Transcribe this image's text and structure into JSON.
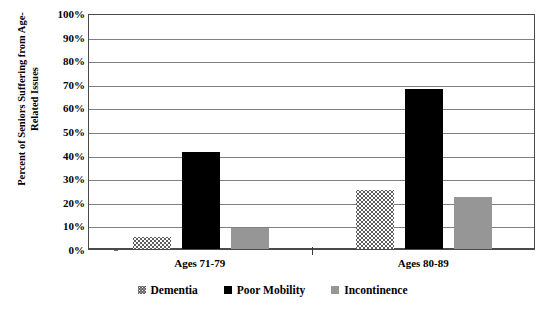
{
  "chart_data": {
    "type": "bar",
    "title": "",
    "xlabel": "",
    "ylabel": "Percent of Seniors Suffering from Age-Related Issues",
    "categories": [
      "Ages 71-79",
      "Ages 80-89"
    ],
    "series": [
      {
        "name": "Dementia",
        "values": [
          5,
          25
        ],
        "color": "#5e5e5e"
      },
      {
        "name": "Poor Mobility",
        "values": [
          41,
          68
        ],
        "color": "#000000"
      },
      {
        "name": "Incontinence",
        "values": [
          9,
          22
        ],
        "color": "#969696"
      }
    ],
    "ylim": [
      0,
      100
    ],
    "ytick_labels": [
      "100%",
      "90%",
      "80%",
      "70%",
      "60%",
      "50%",
      "40%",
      "30%",
      "20%",
      "10%",
      "0%"
    ],
    "ytick_values": [
      100,
      90,
      80,
      70,
      60,
      50,
      40,
      30,
      20,
      10,
      0
    ],
    "grid": true,
    "legend_position": "bottom"
  }
}
